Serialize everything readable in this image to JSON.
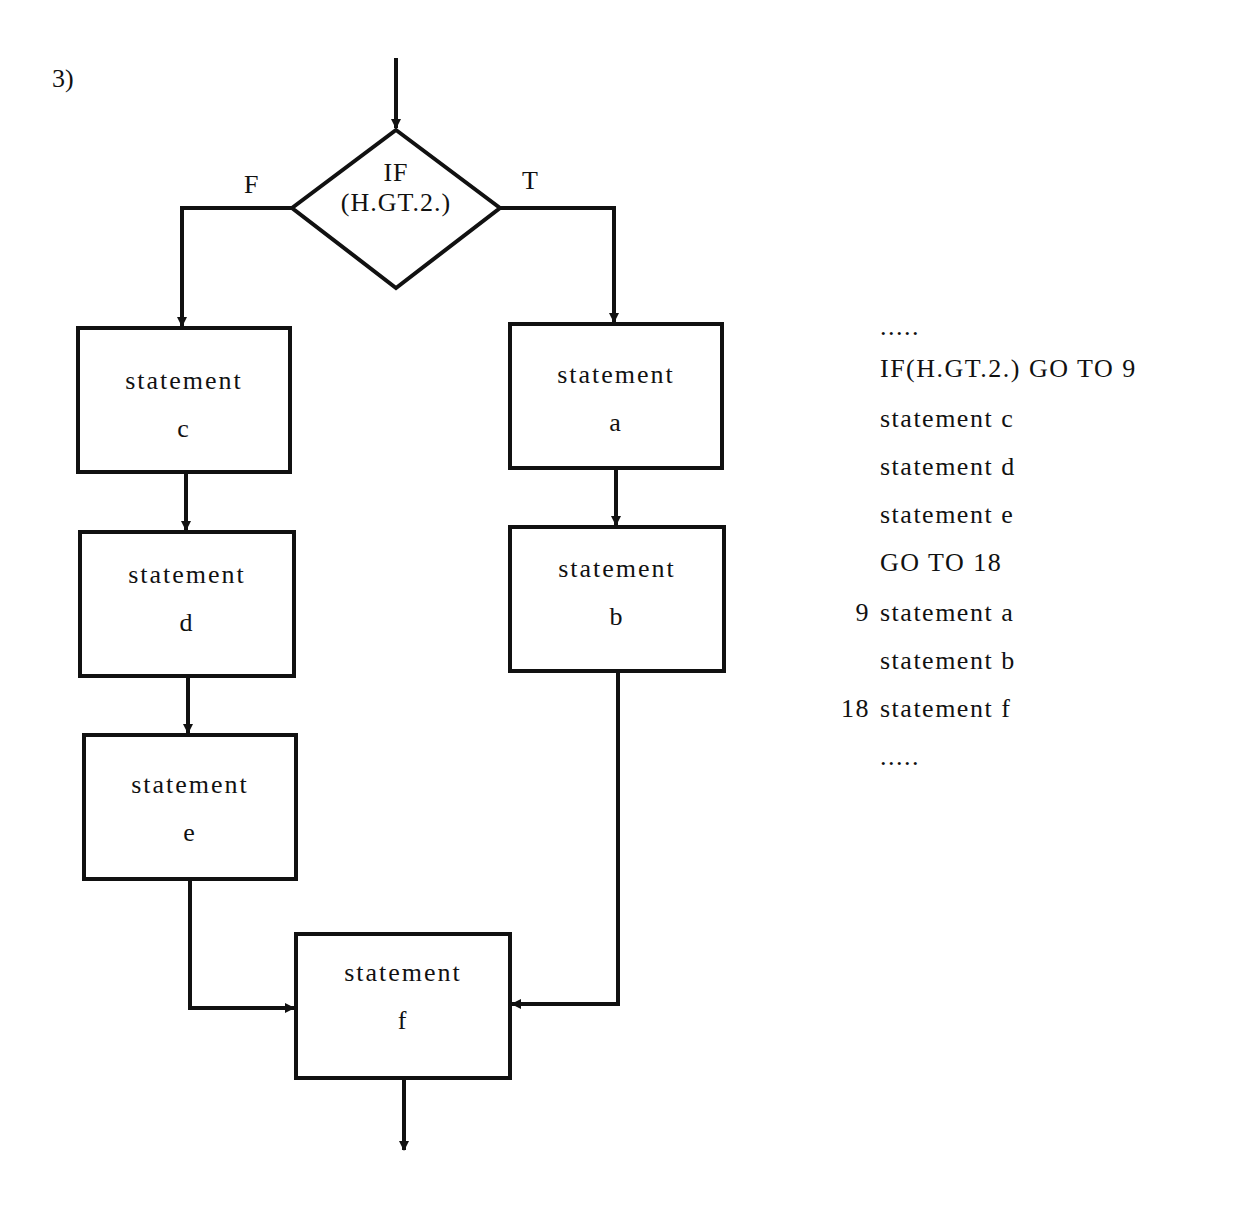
{
  "figure": {
    "label": "3)",
    "decision": {
      "line1": "IF",
      "line2": "(H.GT.2.)",
      "false_label": "F",
      "true_label": "T"
    },
    "boxes": {
      "c": {
        "line1": "statement",
        "line2": "c"
      },
      "d": {
        "line1": "statement",
        "line2": "d"
      },
      "e": {
        "line1": "statement",
        "line2": "e"
      },
      "a": {
        "line1": "statement",
        "line2": "a"
      },
      "b": {
        "line1": "statement",
        "line2": "b"
      },
      "f": {
        "line1": "statement",
        "line2": "f"
      }
    }
  },
  "code": {
    "lines": [
      {
        "num": "",
        "text": "....."
      },
      {
        "num": "",
        "text": "IF(H.GT.2.) GO TO 9"
      },
      {
        "num": "",
        "text": "statement c"
      },
      {
        "num": "",
        "text": "statement d"
      },
      {
        "num": "",
        "text": "statement e"
      },
      {
        "num": "",
        "text": "GO TO 18"
      },
      {
        "num": "9",
        "text": "statement a"
      },
      {
        "num": "",
        "text": "statement b"
      },
      {
        "num": "18",
        "text": "statement f"
      },
      {
        "num": "",
        "text": "....."
      }
    ]
  }
}
